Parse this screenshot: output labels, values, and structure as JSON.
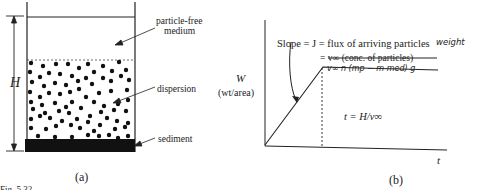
{
  "panel_a": {
    "caption": "(a)",
    "height_label": "H",
    "labels": {
      "particle_free": [
        "particle-free",
        "medium"
      ],
      "dispersion": "dispersion",
      "sediment": "sediment"
    }
  },
  "panel_b": {
    "caption": "(b)",
    "y_label": [
      "W",
      "(wt/area)"
    ],
    "x_label": "t",
    "slope_text": "Slope = J = flux of arriving particles",
    "slope_handwritten_addition": "weight",
    "slope_line2_struck": "= v∞ (conc. of particles)",
    "slope_line2_handwritten": "v∞ n (mp − m med) g",
    "time_label": "t = H/v∞"
  },
  "figure_caption_fragment": "Fig. 5.32"
}
